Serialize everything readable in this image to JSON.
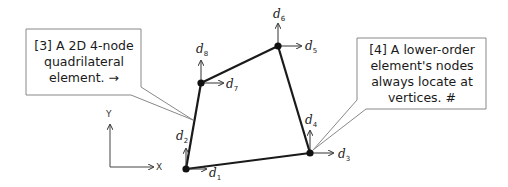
{
  "diagram": {
    "axes": {
      "x_label": "X",
      "y_label": "Y"
    },
    "nodes": [
      {
        "id": 1,
        "x": 186,
        "y": 169,
        "dofs": [
          "d1",
          "d2"
        ]
      },
      {
        "id": 2,
        "x": 310,
        "y": 153,
        "dofs": [
          "d3",
          "d4"
        ]
      },
      {
        "id": 3,
        "x": 278,
        "y": 46,
        "dofs": [
          "d5",
          "d6"
        ]
      },
      {
        "id": 4,
        "x": 201,
        "y": 83,
        "dofs": [
          "d7",
          "d8"
        ]
      }
    ],
    "dof_labels": {
      "d1": {
        "base": "d",
        "sub": "1"
      },
      "d2": {
        "base": "d",
        "sub": "2"
      },
      "d3": {
        "base": "d",
        "sub": "3"
      },
      "d4": {
        "base": "d",
        "sub": "4"
      },
      "d5": {
        "base": "d",
        "sub": "5"
      },
      "d6": {
        "base": "d",
        "sub": "6"
      },
      "d7": {
        "base": "d",
        "sub": "7"
      },
      "d8": {
        "base": "d",
        "sub": "8"
      }
    },
    "callouts": [
      {
        "id": "left",
        "lines": [
          "[3] A 2D 4-node",
          "quadrilateral",
          "element.  →"
        ]
      },
      {
        "id": "right",
        "lines": [
          "[4] A lower-order",
          "element's nodes",
          "always locate at",
          "vertices.  #"
        ]
      }
    ],
    "colors": {
      "edge": "#1a1a1a",
      "node": "#111111",
      "arrow": "#333333",
      "callout_border": "#888888"
    }
  }
}
